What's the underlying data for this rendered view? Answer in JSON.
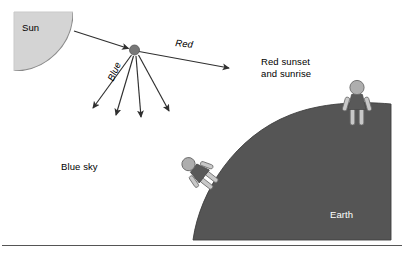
{
  "diagram": {
    "labels": {
      "sun": "Sun",
      "red_ray": "Red",
      "blue_ray": "Blue",
      "blue_sky": "Blue sky",
      "sunset_line1": "Red sunset",
      "sunset_line2": "and sunrise",
      "earth": "Earth"
    },
    "colors": {
      "sun_fill": "#d4d4d4",
      "sun_stroke": "#8c8c8c",
      "earth_fill": "#555555",
      "earth_stroke": "#3a3a3a",
      "figure_body": "#595959",
      "figure_limb": "#c8c8c8",
      "figure_stroke": "#5a5a5a",
      "ray_stroke": "#3a3a3a",
      "scatter_dot": "#777777",
      "earth_label": "#ffffff",
      "rule": "#555555",
      "background": "#ffffff"
    },
    "elements": {
      "sun": {
        "shape": "quarter-disc",
        "cx": 14,
        "cy": 12,
        "r": 59
      },
      "scatter_point": {
        "x": 134,
        "y": 50,
        "r": 5
      },
      "incoming_ray": {
        "from": [
          74,
          31
        ],
        "to": [
          131,
          49
        ]
      },
      "red_ray": {
        "from": [
          139,
          51
        ],
        "to": [
          233,
          69
        ]
      },
      "blue_rays": [
        {
          "from": [
            131,
            55
          ],
          "to": [
            90,
            112
          ]
        },
        {
          "from": [
            133,
            56
          ],
          "to": [
            114,
            120
          ]
        },
        {
          "from": [
            136,
            56
          ],
          "to": [
            141,
            122
          ]
        },
        {
          "from": [
            139,
            55
          ],
          "to": [
            172,
            115
          ]
        }
      ],
      "earth": {
        "shape": "curved-horizon-block",
        "left": 193,
        "right": 391,
        "top": 104,
        "bottom": 240
      },
      "person_on_slope": {
        "x": 195,
        "y": 170,
        "rotation_deg": -52,
        "label": "tilted-observer"
      },
      "person_on_top": {
        "x": 357,
        "y": 98,
        "rotation_deg": 0,
        "label": "upright-observer"
      },
      "bottom_rule": {
        "y": 245,
        "x1": 2,
        "x2": 402
      }
    }
  }
}
